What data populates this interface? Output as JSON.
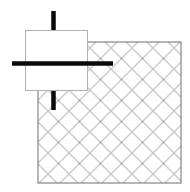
{
  "figure": {
    "title": "",
    "type": "technical-diagram",
    "canvas": {
      "width": 190,
      "height": 192,
      "background": "#ffffff"
    },
    "colors": {
      "hatch_line": "#8a8a8a",
      "outline": "#6e6e6e",
      "block_border": "#b0b0b0",
      "block_fill": "#ffffff",
      "bar": "#0a0a0a"
    },
    "hatched_region": {
      "name": "hatched-square",
      "label": "",
      "x": 38,
      "y": 42,
      "width": 143,
      "height": 141,
      "pattern": "cross-hatch-diagonal",
      "pattern_spacing": 21,
      "stroke_width": 0.9
    },
    "block": {
      "name": "white-block",
      "label": "",
      "x": 25,
      "y": 30,
      "width": 63,
      "height": 61,
      "fill": "#ffffff",
      "stroke": "#b0b0b0",
      "stroke_width": 1
    },
    "bars": [
      {
        "name": "vertical-bar-upper",
        "orientation": "vertical",
        "x1": 53.5,
        "y1": 11,
        "x2": 53.5,
        "y2": 30,
        "thickness": 4.5
      },
      {
        "name": "vertical-bar-lower",
        "orientation": "vertical",
        "x1": 53.5,
        "y1": 91,
        "x2": 53.5,
        "y2": 110,
        "thickness": 4.5
      },
      {
        "name": "horizontal-bar",
        "orientation": "horizontal",
        "x1": 12,
        "y1": 63.5,
        "x2": 113,
        "y2": 63.5,
        "thickness": 4.5
      }
    ]
  }
}
